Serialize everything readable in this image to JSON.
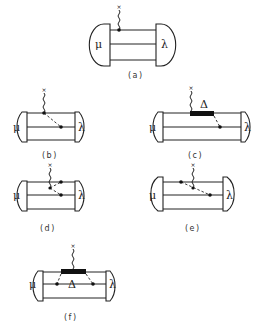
{
  "figure": {
    "panels": [
      {
        "id": "a",
        "label": "(a)",
        "left_symbol": "μ",
        "right_symbol": "λ",
        "description": "photon attached to top quark line"
      },
      {
        "id": "b",
        "label": "(b)",
        "left_symbol": "μ",
        "right_symbol": "λ",
        "description": "photon on top line with dashed exchange to middle line"
      },
      {
        "id": "c",
        "label": "(c)",
        "left_symbol": "μ",
        "right_symbol": "λ",
        "delta_symbol": "Δ",
        "description": "photon on Δ intermediate state with dashed exchange"
      },
      {
        "id": "d",
        "label": "(d)",
        "left_symbol": "μ",
        "right_symbol": "λ",
        "description": "photon on dashed exchange line between top and middle"
      },
      {
        "id": "e",
        "label": "(e)",
        "left_symbol": "μ",
        "right_symbol": "λ",
        "description": "photon on dashed exchange line crossing"
      },
      {
        "id": "f",
        "label": "(f)",
        "left_symbol": "μ",
        "right_symbol": "λ",
        "delta_symbol": "Δ",
        "description": "photon on Δ with two dashed exchanges"
      }
    ],
    "photon_end_marker": "×"
  }
}
